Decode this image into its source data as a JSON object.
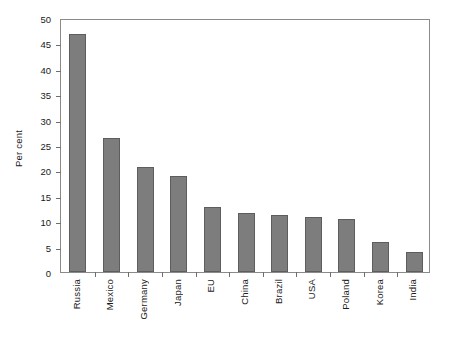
{
  "chart_data": {
    "type": "bar",
    "title": "",
    "xlabel": "",
    "ylabel": "Per cent",
    "ylim": [
      0,
      50
    ],
    "ytick_step": 5,
    "ytick_labels": [
      "0",
      "5",
      "10",
      "15",
      "20",
      "25",
      "30",
      "35",
      "40",
      "45",
      "50"
    ],
    "grid": false,
    "legend": null,
    "bar_color": "#7d7d7d",
    "bar_edge_color": "#5d5d5d",
    "axis_color": "#8a8a8a",
    "categories": [
      "Russia",
      "Mexico",
      "Germany",
      "Japan",
      "EU",
      "China",
      "Brazil",
      "USA",
      "Poland",
      "Korea",
      "India"
    ],
    "values": [
      46.8,
      26.4,
      20.6,
      18.9,
      12.8,
      11.7,
      11.2,
      10.9,
      10.5,
      5.9,
      4.0
    ]
  }
}
